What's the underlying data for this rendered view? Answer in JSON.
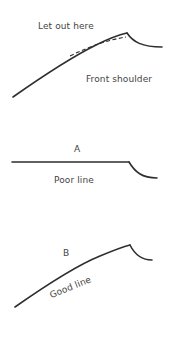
{
  "figure_top": {
    "annotation": "Let out here",
    "caption": "Front shoulder"
  },
  "figure_a": {
    "letter": "A",
    "caption": "Poor line"
  },
  "figure_b": {
    "letter": "B",
    "caption": "Good line"
  },
  "colors": {
    "line": "#2e2e2e",
    "text": "#444444",
    "background": "#ffffff"
  }
}
